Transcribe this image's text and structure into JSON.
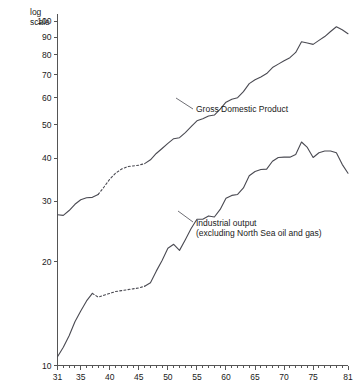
{
  "chart_data": {
    "type": "line",
    "title": "",
    "subtitle": "",
    "xlabel": "",
    "ylabel": "",
    "scale_note": "log scale",
    "scale_note_line1": "log",
    "scale_note_line2": "scale",
    "y_axis_type": "log",
    "ylim": [
      10,
      105
    ],
    "xlim": [
      31,
      81
    ],
    "grid": false,
    "legend_position": "inline-annotation",
    "y_ticks": [
      10,
      20,
      30,
      40,
      50,
      60,
      70,
      80,
      90,
      100
    ],
    "y_tick_labels": [
      "10",
      "20",
      "30",
      "40",
      "50",
      "60",
      "70",
      "80",
      "90",
      "100"
    ],
    "x_ticks": [
      31,
      32,
      33,
      34,
      35,
      36,
      37,
      38,
      39,
      40,
      41,
      42,
      43,
      44,
      45,
      46,
      47,
      48,
      49,
      50,
      51,
      52,
      53,
      54,
      55,
      56,
      57,
      58,
      59,
      60,
      61,
      62,
      63,
      64,
      65,
      66,
      67,
      68,
      69,
      70,
      71,
      72,
      73,
      74,
      75,
      76,
      77,
      78,
      79,
      80,
      81
    ],
    "x_major_ticks": [
      31,
      35,
      40,
      45,
      50,
      55,
      60,
      65,
      70,
      75,
      81
    ],
    "x_major_tick_labels": [
      "31",
      "35",
      "40",
      "45",
      "50",
      "55",
      "60",
      "65",
      "70",
      "75",
      "81"
    ],
    "series": [
      {
        "name": "Gross Domestic Product",
        "label": "Gross Domestic Product",
        "label_lines": [
          "Gross Domestic Product"
        ],
        "style": "solid-with-dashed-gap",
        "color": "#4a4a52",
        "x": [
          31,
          32,
          33,
          34,
          35,
          36,
          37,
          38,
          39,
          40,
          41,
          42,
          43,
          44,
          45,
          46,
          47,
          48,
          49,
          50,
          51,
          52,
          53,
          54,
          55,
          56,
          57,
          58,
          59,
          60,
          61,
          62,
          63,
          64,
          65,
          66,
          67,
          68,
          69,
          70,
          71,
          72,
          73,
          74,
          75,
          76,
          77,
          78,
          79,
          80,
          81
        ],
        "values": [
          27.4,
          27.3,
          28.2,
          29.4,
          30.3,
          30.7,
          30.8,
          31.4,
          33.0,
          34.8,
          36.2,
          37.2,
          37.8,
          38.0,
          38.2,
          38.6,
          39.6,
          41.3,
          42.7,
          44.2,
          45.6,
          45.9,
          47.5,
          49.4,
          51.4,
          52.1,
          53.1,
          53.4,
          55.6,
          58.2,
          59.4,
          60.0,
          62.5,
          65.9,
          67.6,
          68.9,
          70.5,
          73.4,
          75.1,
          76.8,
          78.4,
          81.2,
          87.2,
          86.5,
          85.7,
          88.0,
          90.3,
          93.4,
          96.4,
          94.5,
          92.0
        ],
        "dashed_range": [
          38,
          46
        ]
      },
      {
        "name": "Industrial output (excluding North Sea oil and gas)",
        "label": "Industrial output (excluding North Sea oil and gas)",
        "label_lines": [
          "Industrial output",
          "(excluding North Sea oil and gas)"
        ],
        "style": "solid-with-dashed-gap",
        "color": "#4a4a52",
        "x": [
          31,
          32,
          33,
          34,
          35,
          36,
          37,
          38,
          39,
          40,
          41,
          42,
          43,
          44,
          45,
          46,
          47,
          48,
          49,
          50,
          51,
          52,
          53,
          54,
          55,
          56,
          57,
          58,
          59,
          60,
          61,
          62,
          63,
          64,
          65,
          66,
          67,
          68,
          69,
          70,
          71,
          72,
          73,
          74,
          75,
          76,
          77,
          78,
          79,
          80,
          81
        ],
        "values": [
          10.6,
          11.3,
          12.2,
          13.4,
          14.4,
          15.4,
          16.2,
          15.8,
          16.0,
          16.2,
          16.4,
          16.5,
          16.6,
          16.7,
          16.8,
          17.0,
          17.4,
          18.8,
          20.2,
          21.9,
          22.5,
          21.6,
          23.2,
          25.0,
          26.6,
          26.6,
          27.2,
          27.0,
          28.4,
          30.6,
          31.2,
          31.4,
          32.8,
          35.6,
          36.6,
          37.1,
          37.2,
          39.2,
          40.2,
          40.3,
          40.3,
          41.0,
          44.6,
          43.0,
          40.2,
          41.5,
          42.0,
          42.0,
          41.5,
          38.4,
          36.2
        ],
        "dashed_range": [
          37,
          46
        ]
      }
    ],
    "annotations": [
      {
        "id": "gdp-annotation",
        "text": "Gross Domestic Product",
        "x_px": 196,
        "y_px": 112
      },
      {
        "id": "industrial-annotation",
        "line1": "Industrial output",
        "line2": "(excluding North Sea oil and gas)",
        "x_px": 196,
        "y_px": 226
      }
    ]
  }
}
